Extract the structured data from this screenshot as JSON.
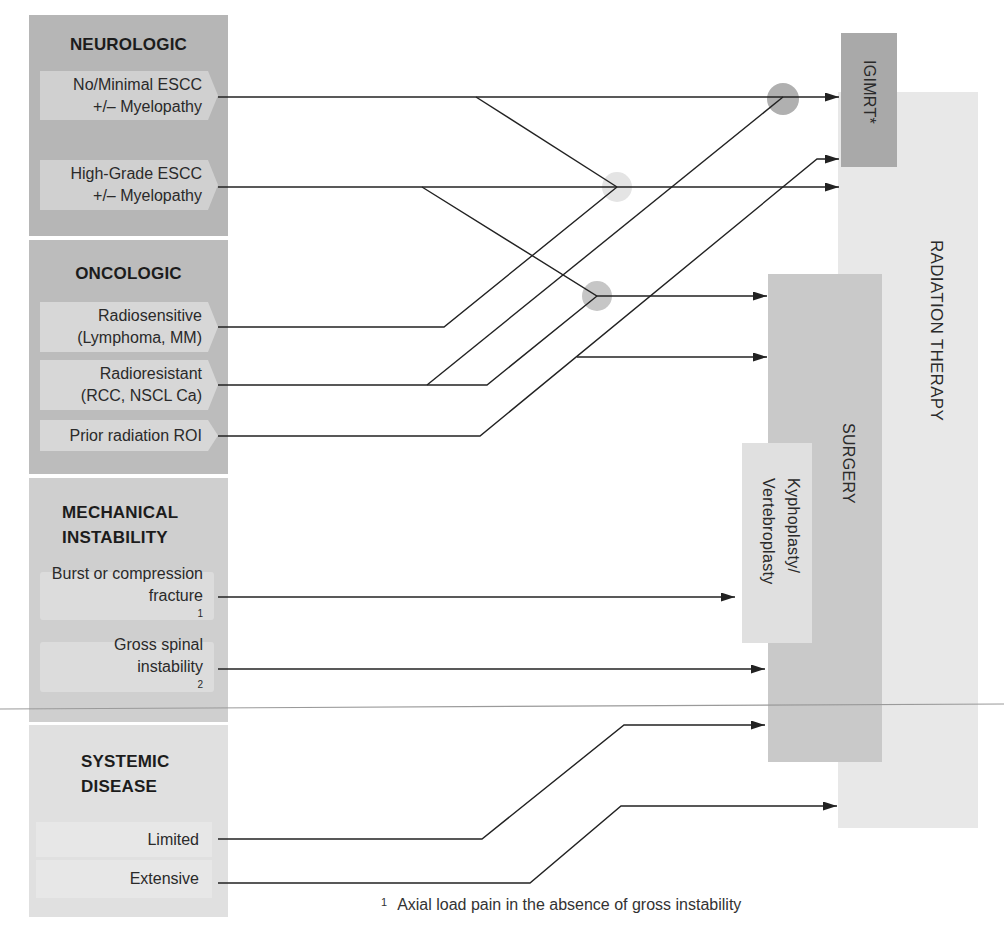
{
  "categories": [
    {
      "id": "neurologic",
      "title_lines": [
        "NEUROLOGIC"
      ],
      "items": [
        {
          "lines": [
            "No/Minimal ESCC",
            "+/– Myelopathy"
          ]
        },
        {
          "lines": [
            "High-Grade ESCC",
            "+/– Myelopathy"
          ]
        }
      ]
    },
    {
      "id": "oncologic",
      "title_lines": [
        "ONCOLOGIC"
      ],
      "items": [
        {
          "lines": [
            "Radiosensitive",
            "(Lymphoma, MM)"
          ]
        },
        {
          "lines": [
            "Radioresistant",
            "(RCC, NSCL Ca)"
          ]
        },
        {
          "lines": [
            "Prior radiation ROI"
          ]
        }
      ]
    },
    {
      "id": "mechanical",
      "title_lines": [
        "MECHANICAL",
        "INSTABILITY"
      ],
      "items": [
        {
          "lines": [
            "Burst or compression",
            "fracture"
          ],
          "sup": "1"
        },
        {
          "lines": [
            "Gross spinal",
            "instability"
          ],
          "sup": "2"
        }
      ]
    },
    {
      "id": "systemic",
      "title_lines": [
        "SYSTEMIC",
        "DISEASE"
      ],
      "items": [
        {
          "lines": [
            "Limited"
          ]
        },
        {
          "lines": [
            "Extensive"
          ]
        }
      ]
    }
  ],
  "treatments": {
    "igimrt": "IGIMRT*",
    "radiation_therapy": "RADIATION THERAPY",
    "surgery": "SURGERY",
    "kyphoplasty_lines": [
      "Kyphoplasty/",
      "Vertebroplasty"
    ]
  },
  "connections": [
    {
      "from": "No/Minimal ESCC +/– Myelopathy",
      "to": "IGIMRT*"
    },
    {
      "from": "No/Minimal ESCC +/– Myelopathy",
      "to": "RADIATION THERAPY",
      "via": "junction-light"
    },
    {
      "from": "High-Grade ESCC +/– Myelopathy",
      "to": "RADIATION THERAPY"
    },
    {
      "from": "High-Grade ESCC +/– Myelopathy",
      "to": "SURGERY",
      "via": "junction-medium"
    },
    {
      "from": "Radiosensitive (Lymphoma, MM)",
      "to": "RADIATION THERAPY",
      "via": "junction-light"
    },
    {
      "from": "Radioresistant (RCC, NSCL Ca)",
      "to": "IGIMRT*",
      "via": "junction-dark"
    },
    {
      "from": "Radioresistant (RCC, NSCL Ca)",
      "to": "SURGERY",
      "via": "junction-medium"
    },
    {
      "from": "Prior radiation ROI",
      "to": "IGIMRT*"
    },
    {
      "from": "Prior radiation ROI",
      "to": "SURGERY"
    },
    {
      "from": "Burst or compression fracture",
      "to": "Kyphoplasty/Vertebroplasty"
    },
    {
      "from": "Gross spinal instability",
      "to": "SURGERY"
    },
    {
      "from": "Limited",
      "to": "SURGERY"
    },
    {
      "from": "Extensive",
      "to": "RADIATION THERAPY"
    }
  ],
  "footnote": {
    "marker": "1",
    "text": "Axial load pain in the absence of gross instability"
  },
  "colors": {
    "neurologic_panel": "#b6b6b6",
    "oncologic_panel": "#bcbcbc",
    "mechanical_panel": "#cfcfcf",
    "systemic_panel": "#e0e0e0",
    "igimrt": "#a9a9a9",
    "radiation_therapy": "#e8e8e8",
    "surgery": "#c9c9c9",
    "kyphoplasty": "#e0e0e0",
    "line": "#222222"
  }
}
